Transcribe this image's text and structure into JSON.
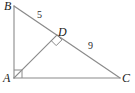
{
  "figure": {
    "kind": "geometry-diagram",
    "background_color": "#ffffff",
    "stroke_color": "#8a8a8a",
    "label_color": "#1a1a1a",
    "width": 135,
    "height": 93,
    "vertices": [
      {
        "name": "B",
        "label": "B",
        "x": 14,
        "y": 6
      },
      {
        "name": "A",
        "label": "A",
        "x": 14,
        "y": 78
      },
      {
        "name": "C",
        "label": "C",
        "x": 120,
        "y": 78
      },
      {
        "name": "D",
        "label": "D",
        "x": 57,
        "y": 35
      }
    ],
    "segments": [
      {
        "name": "segment-AB",
        "from": "A",
        "to": "B"
      },
      {
        "name": "segment-AC",
        "from": "A",
        "to": "C"
      },
      {
        "name": "segment-BC",
        "from": "B",
        "to": "C"
      },
      {
        "name": "segment-AD",
        "from": "A",
        "to": "D"
      }
    ],
    "side_labels": [
      {
        "name": "length-BD",
        "value": "5",
        "segment": "BD"
      },
      {
        "name": "length-DC",
        "value": "9",
        "segment": "DC"
      }
    ],
    "right_angles": [
      {
        "name": "right-angle-A",
        "at": "A",
        "between": [
          "AB",
          "AC"
        ]
      },
      {
        "name": "right-angle-D",
        "at": "D",
        "between": [
          "AD",
          "BC"
        ]
      }
    ]
  }
}
